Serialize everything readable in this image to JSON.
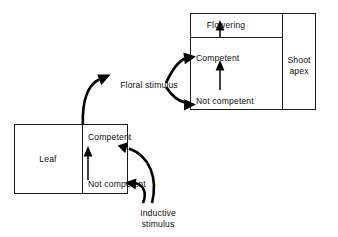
{
  "figure": {
    "background_color": "#ffffff",
    "line_color": "#1a1a1a"
  },
  "shoot_apex_box": {
    "name": "Shoot apex",
    "apex_label": "Shoot apex",
    "apex_label_line1": "Shoot",
    "apex_label_line2": "apex",
    "states": {
      "flowering": "Flowering",
      "competent": "Competent",
      "not_competent": "Not competent"
    }
  },
  "leaf_box": {
    "name": "Leaf",
    "leaf_label": "Leaf",
    "states": {
      "competent": "Competent",
      "not_competent": "Not competent"
    }
  },
  "signals": {
    "floral_stimulus": "Floral stimulus",
    "inductive_stimulus": "Inductive stimulus",
    "inductive_stimulus_line1": "Inductive",
    "inductive_stimulus_line2": "stimulus"
  },
  "arrows": [
    {
      "id": "inductive-to-leaf-not-competent",
      "from": "Inductive stimulus",
      "to": "Leaf / Not competent",
      "style": "thick-curved"
    },
    {
      "id": "inductive-to-leaf-competent",
      "from": "Inductive stimulus",
      "to": "Leaf / Competent",
      "style": "thick-curved"
    },
    {
      "id": "leaf-not-competent-to-competent",
      "from": "Leaf / Not competent",
      "to": "Leaf / Competent",
      "style": "thin-straight-up"
    },
    {
      "id": "leaf-to-floral-stimulus",
      "from": "Leaf / Competent",
      "to": "Floral stimulus",
      "style": "thick-curved"
    },
    {
      "id": "floral-stimulus-to-apex-competent",
      "from": "Floral stimulus",
      "to": "Shoot apex / Competent",
      "style": "thick-curved"
    },
    {
      "id": "floral-stimulus-to-apex-not-competent",
      "from": "Floral stimulus",
      "to": "Shoot apex / Not competent",
      "style": "thick-curved"
    },
    {
      "id": "apex-not-competent-to-competent",
      "from": "Shoot apex / Not competent",
      "to": "Shoot apex / Competent",
      "style": "thin-straight-up"
    },
    {
      "id": "apex-competent-to-flowering",
      "from": "Shoot apex / Competent",
      "to": "Shoot apex / Flowering",
      "style": "thin-straight-up"
    }
  ]
}
